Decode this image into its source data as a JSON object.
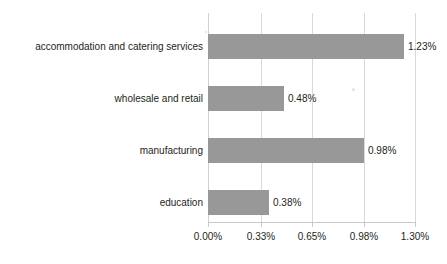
{
  "chart_data": {
    "type": "bar",
    "orientation": "horizontal",
    "title": "",
    "subtitle": "",
    "xlabel": "",
    "ylabel": "",
    "categories": [
      "accommodation and catering services",
      "wholesale and retail",
      "manufacturing",
      "education"
    ],
    "values": [
      1.23,
      0.48,
      0.98,
      0.38
    ],
    "value_labels": [
      "1.23%",
      "0.48%",
      "0.98%",
      "0.38%"
    ],
    "xlim": [
      0.0,
      1.3
    ],
    "xticks": [
      0.0,
      0.33,
      0.65,
      0.98,
      1.3
    ],
    "xtick_labels": [
      "0.00%",
      "0.33%",
      "0.65%",
      "0.98%",
      "1.30%"
    ],
    "grid": true,
    "legend": false,
    "legend_position": "none",
    "series": [
      {
        "name": "share",
        "values": [
          1.23,
          0.48,
          0.98,
          0.38
        ],
        "color": "#989898"
      }
    ],
    "colors": {
      "bar": "#989898",
      "background": "#ffffff",
      "gridline": "#d9d9d9",
      "axis": "#c9c9c9",
      "text": "#231f20"
    }
  }
}
